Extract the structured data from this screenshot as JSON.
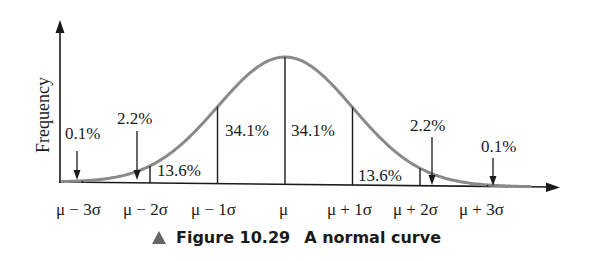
{
  "chart_data": {
    "type": "area",
    "title": "Figure 10.29 A normal curve",
    "xlabel": "",
    "ylabel": "Frequency",
    "grid": false,
    "legend": null,
    "tick_labels": [
      "μ − 3σ",
      "μ − 2σ",
      "μ − 1σ",
      "μ",
      "μ + 1σ",
      "μ + 2σ",
      "μ + 3σ"
    ],
    "x": [
      -3,
      -2,
      -1,
      0,
      1,
      2,
      3
    ],
    "regions": [
      {
        "range": [
          "-inf",
          "-3σ"
        ],
        "percent": 0.1,
        "label": "0.1%"
      },
      {
        "range": [
          "-3σ",
          "-2σ"
        ],
        "percent": 2.2,
        "label": "2.2%"
      },
      {
        "range": [
          "-2σ",
          "-1σ"
        ],
        "percent": 13.6,
        "label": "13.6%"
      },
      {
        "range": [
          "-1σ",
          "μ"
        ],
        "percent": 34.1,
        "label": "34.1%"
      },
      {
        "range": [
          "μ",
          "+1σ"
        ],
        "percent": 34.1,
        "label": "34.1%"
      },
      {
        "range": [
          "+1σ",
          "+2σ"
        ],
        "percent": 13.6,
        "label": "13.6%"
      },
      {
        "range": [
          "+2σ",
          "+3σ"
        ],
        "percent": 2.2,
        "label": "2.2%"
      },
      {
        "range": [
          "+3σ",
          "+inf"
        ],
        "percent": 0.1,
        "label": "0.1%"
      }
    ],
    "curve_color": "#8a8a8a",
    "axis_color": "#1a1a1a"
  },
  "caption": {
    "figure_number": "Figure 10.29",
    "text": "A normal curve",
    "marker_color": "#666666"
  }
}
